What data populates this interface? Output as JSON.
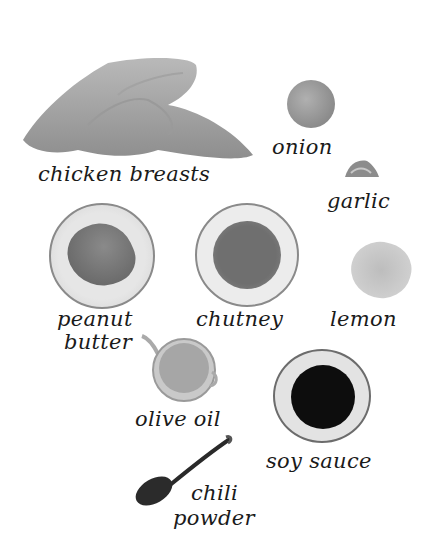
{
  "ingredients": [
    {
      "label": "chicken breasts",
      "icon": "chicken-breasts-icon"
    },
    {
      "label": "onion",
      "icon": "onion-icon"
    },
    {
      "label": "garlic",
      "icon": "garlic-icon"
    },
    {
      "label_line1": "peanut",
      "label_line2": "butter",
      "icon": "peanut-butter-bowl-icon"
    },
    {
      "label": "chutney",
      "icon": "chutney-bowl-icon"
    },
    {
      "label": "lemon",
      "icon": "lemon-icon"
    },
    {
      "label": "olive oil",
      "icon": "olive-oil-jug-icon"
    },
    {
      "label": "soy sauce",
      "icon": "soy-sauce-dish-icon"
    },
    {
      "label_line1": "chili",
      "label_line2": "powder",
      "icon": "chili-powder-spoon-icon"
    }
  ],
  "colors": {
    "background": "#ffffff",
    "text": "#1a1a1a",
    "soy_sauce": "#0d0d0d",
    "chutney": "#6f6f6f"
  }
}
